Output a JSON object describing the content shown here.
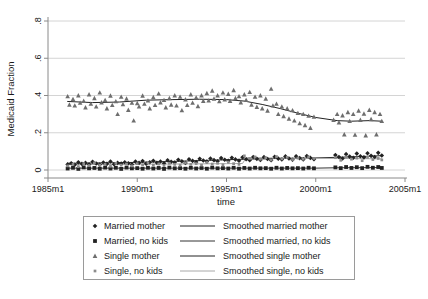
{
  "chart_data": {
    "type": "scatter",
    "title": "",
    "xlabel": "time",
    "ylabel": "Medicaid Fraction",
    "xlim": [
      1985.0,
      2005.0
    ],
    "ylim": [
      0,
      0.8
    ],
    "grid": true,
    "x_ticks": [
      "1985m1",
      "1990m1",
      "1995m1",
      "2000m1",
      "2005m1"
    ],
    "x_tick_values": [
      1985,
      1990,
      1995,
      2000,
      2005
    ],
    "y_ticks": [
      "0",
      ".2",
      ".4",
      ".6",
      ".8"
    ],
    "y_tick_values": [
      0,
      0.2,
      0.4,
      0.6,
      0.8
    ],
    "legend_position": "below-plot",
    "series": [
      {
        "name": "Married mother",
        "marker": "diamond",
        "color": "#222222",
        "x": [
          1986.1,
          1986.3,
          1986.5,
          1986.7,
          1986.9,
          1987.1,
          1987.3,
          1987.5,
          1987.7,
          1987.9,
          1988.1,
          1988.3,
          1988.5,
          1988.7,
          1988.9,
          1989.1,
          1989.3,
          1989.5,
          1989.7,
          1989.9,
          1990.1,
          1990.3,
          1990.5,
          1990.7,
          1990.9,
          1991.1,
          1991.3,
          1991.5,
          1991.7,
          1991.9,
          1992.1,
          1992.3,
          1992.5,
          1992.7,
          1992.9,
          1993.1,
          1993.3,
          1993.5,
          1993.7,
          1993.9,
          1994.1,
          1994.3,
          1994.5,
          1994.7,
          1994.9,
          1995.1,
          1995.3,
          1995.5,
          1995.7,
          1995.9,
          1996.1,
          1996.3,
          1996.5,
          1996.7,
          1996.9,
          1997.1,
          1997.3,
          1997.5,
          1997.7,
          1997.9,
          1998.1,
          1998.3,
          1998.5,
          1998.7,
          1998.9,
          1999.1,
          1999.3,
          1999.5,
          1999.7,
          1999.9,
          2001.1,
          2001.3,
          2001.5,
          2001.7,
          2001.9,
          2002.1,
          2002.3,
          2002.5,
          2002.7,
          2002.9,
          2003.1,
          2003.3,
          2003.5,
          2003.7
        ],
        "y": [
          0.03,
          0.036,
          0.028,
          0.041,
          0.033,
          0.038,
          0.03,
          0.044,
          0.035,
          0.029,
          0.04,
          0.033,
          0.046,
          0.031,
          0.038,
          0.034,
          0.042,
          0.036,
          0.03,
          0.045,
          0.038,
          0.048,
          0.034,
          0.042,
          0.05,
          0.039,
          0.046,
          0.036,
          0.052,
          0.044,
          0.04,
          0.055,
          0.047,
          0.038,
          0.058,
          0.049,
          0.043,
          0.06,
          0.051,
          0.046,
          0.062,
          0.053,
          0.047,
          0.064,
          0.055,
          0.049,
          0.066,
          0.057,
          0.05,
          0.068,
          0.058,
          0.052,
          0.07,
          0.06,
          0.054,
          0.069,
          0.059,
          0.053,
          0.071,
          0.061,
          0.056,
          0.073,
          0.062,
          0.055,
          0.074,
          0.064,
          0.057,
          0.075,
          0.065,
          0.058,
          0.08,
          0.07,
          0.062,
          0.085,
          0.072,
          0.066,
          0.088,
          0.074,
          0.068,
          0.09,
          0.076,
          0.07,
          0.092,
          0.078
        ]
      },
      {
        "name": "Married, no kids",
        "marker": "square",
        "color": "#222222",
        "x": [
          1986.1,
          1986.4,
          1986.7,
          1987.0,
          1987.3,
          1987.6,
          1987.9,
          1988.2,
          1988.5,
          1988.8,
          1989.1,
          1989.4,
          1989.7,
          1990.0,
          1990.3,
          1990.6,
          1990.9,
          1991.2,
          1991.5,
          1991.8,
          1992.1,
          1992.4,
          1992.7,
          1993.0,
          1993.3,
          1993.6,
          1993.9,
          1994.2,
          1994.5,
          1994.8,
          1995.1,
          1995.4,
          1995.7,
          1996.0,
          1996.3,
          1996.6,
          1996.9,
          1997.2,
          1997.5,
          1997.8,
          1998.1,
          1998.4,
          1998.7,
          1999.0,
          1999.3,
          1999.6,
          1999.9,
          2001.1,
          2001.4,
          2001.7,
          2002.0,
          2002.3,
          2002.6,
          2002.9,
          2003.2,
          2003.5,
          2003.7
        ],
        "y": [
          0.008,
          0.012,
          0.006,
          0.014,
          0.009,
          0.011,
          0.007,
          0.013,
          0.008,
          0.012,
          0.006,
          0.013,
          0.009,
          0.01,
          0.007,
          0.012,
          0.008,
          0.011,
          0.006,
          0.013,
          0.009,
          0.01,
          0.007,
          0.012,
          0.008,
          0.011,
          0.007,
          0.013,
          0.009,
          0.01,
          0.008,
          0.012,
          0.007,
          0.011,
          0.008,
          0.012,
          0.009,
          0.01,
          0.007,
          0.012,
          0.008,
          0.011,
          0.009,
          0.01,
          0.008,
          0.012,
          0.009,
          0.014,
          0.01,
          0.016,
          0.011,
          0.015,
          0.01,
          0.017,
          0.012,
          0.016,
          0.011
        ]
      },
      {
        "name": "Single mother",
        "marker": "triangle",
        "color": "#6e6e6e",
        "x": [
          1986.1,
          1986.2,
          1986.4,
          1986.5,
          1986.7,
          1986.8,
          1987.0,
          1987.1,
          1987.3,
          1987.4,
          1987.6,
          1987.7,
          1987.9,
          1988.0,
          1988.2,
          1988.3,
          1988.5,
          1988.6,
          1988.8,
          1988.9,
          1989.1,
          1989.2,
          1989.4,
          1989.5,
          1989.7,
          1989.8,
          1990.0,
          1990.1,
          1990.3,
          1990.4,
          1990.6,
          1990.7,
          1990.9,
          1991.0,
          1991.2,
          1991.3,
          1991.5,
          1991.6,
          1991.8,
          1991.9,
          1992.1,
          1992.2,
          1992.4,
          1992.5,
          1992.7,
          1992.8,
          1993.0,
          1993.1,
          1993.3,
          1993.4,
          1993.6,
          1993.7,
          1993.9,
          1994.0,
          1994.2,
          1994.3,
          1994.5,
          1994.6,
          1994.8,
          1994.9,
          1995.1,
          1995.2,
          1995.4,
          1995.5,
          1995.7,
          1995.8,
          1996.0,
          1996.1,
          1996.3,
          1996.4,
          1996.6,
          1996.7,
          1996.9,
          1997.0,
          1997.2,
          1997.3,
          1997.5,
          1997.6,
          1997.8,
          1997.9,
          1998.1,
          1998.2,
          1998.4,
          1998.5,
          1998.7,
          1998.8,
          1999.0,
          1999.1,
          1999.3,
          1999.4,
          1999.6,
          1999.7,
          1999.9,
          2001.0,
          2001.2,
          2001.3,
          2001.5,
          2001.6,
          2001.8,
          2001.9,
          2002.1,
          2002.2,
          2002.4,
          2002.5,
          2002.7,
          2002.8,
          2003.0,
          2003.1,
          2003.3,
          2003.4,
          2003.6,
          2003.7
        ],
        "y": [
          0.395,
          0.35,
          0.38,
          0.345,
          0.4,
          0.36,
          0.37,
          0.335,
          0.405,
          0.355,
          0.385,
          0.34,
          0.415,
          0.362,
          0.375,
          0.33,
          0.398,
          0.348,
          0.368,
          0.3,
          0.392,
          0.352,
          0.382,
          0.322,
          0.36,
          0.265,
          0.358,
          0.34,
          0.398,
          0.355,
          0.372,
          0.33,
          0.39,
          0.348,
          0.41,
          0.362,
          0.375,
          0.335,
          0.385,
          0.35,
          0.4,
          0.345,
          0.392,
          0.32,
          0.378,
          0.348,
          0.405,
          0.36,
          0.388,
          0.342,
          0.4,
          0.37,
          0.412,
          0.372,
          0.425,
          0.382,
          0.4,
          0.368,
          0.415,
          0.378,
          0.408,
          0.37,
          0.428,
          0.385,
          0.395,
          0.362,
          0.405,
          0.375,
          0.418,
          0.35,
          0.392,
          0.338,
          0.4,
          0.33,
          0.382,
          0.318,
          0.435,
          0.345,
          0.355,
          0.3,
          0.34,
          0.288,
          0.33,
          0.275,
          0.32,
          0.265,
          0.305,
          0.25,
          0.3,
          0.24,
          0.29,
          0.225,
          0.285,
          0.268,
          0.3,
          0.255,
          0.292,
          0.19,
          0.31,
          0.262,
          0.3,
          0.188,
          0.318,
          0.268,
          0.302,
          0.185,
          0.322,
          0.272,
          0.31,
          0.19,
          0.3,
          0.262
        ]
      },
      {
        "name": "Single, no kids",
        "marker": "dot",
        "color": "#8c8c8c",
        "x": [
          1986.1,
          1986.4,
          1986.7,
          1987.0,
          1987.3,
          1987.6,
          1987.9,
          1988.2,
          1988.5,
          1988.8,
          1989.1,
          1989.4,
          1989.7,
          1990.0,
          1990.3,
          1990.6,
          1990.9,
          1991.2,
          1991.5,
          1991.8,
          1992.1,
          1992.4,
          1992.7,
          1993.0,
          1993.3,
          1993.6,
          1993.9,
          1994.2,
          1994.5,
          1994.8,
          1995.1,
          1995.4,
          1995.7,
          1996.0,
          1996.3,
          1996.6,
          1996.9,
          1997.2,
          1997.5,
          1997.8,
          1998.1,
          1998.4,
          1998.7,
          1999.0,
          1999.3,
          1999.6,
          1999.9,
          2001.1,
          2001.4,
          2001.7,
          2002.0,
          2002.3,
          2002.6,
          2002.9,
          2003.2,
          2003.5,
          2003.7
        ],
        "y": [
          0.022,
          0.03,
          0.018,
          0.034,
          0.024,
          0.038,
          0.026,
          0.03,
          0.02,
          0.036,
          0.026,
          0.032,
          0.022,
          0.034,
          0.028,
          0.038,
          0.026,
          0.032,
          0.024,
          0.036,
          0.03,
          0.026,
          0.038,
          0.03,
          0.034,
          0.026,
          0.04,
          0.032,
          0.036,
          0.028,
          0.042,
          0.034,
          0.03,
          0.076,
          0.062,
          0.07,
          0.058,
          0.066,
          0.054,
          0.072,
          0.06,
          0.068,
          0.056,
          0.064,
          0.058,
          0.07,
          0.062,
          0.066,
          0.052,
          0.07,
          0.058,
          0.064,
          0.05,
          0.068,
          0.056,
          0.062,
          0.054
        ]
      }
    ],
    "smoothed": [
      {
        "name": "Smoothed married mother",
        "color": "#222222",
        "x": [
          1986.1,
          1988.0,
          1990.0,
          1992.0,
          1994.0,
          1996.0,
          1998.0,
          2000.0,
          2001.2,
          2003.0,
          2003.7
        ],
        "y": [
          0.036,
          0.038,
          0.041,
          0.046,
          0.052,
          0.058,
          0.062,
          0.065,
          0.068,
          0.074,
          0.077
        ]
      },
      {
        "name": "Smoothed married, no kids",
        "color": "#333333",
        "x": [
          1986.1,
          1989.0,
          1992.0,
          1995.0,
          1998.0,
          2000.0,
          2001.2,
          2003.7
        ],
        "y": [
          0.01,
          0.01,
          0.01,
          0.01,
          0.01,
          0.01,
          0.012,
          0.013
        ]
      },
      {
        "name": "Smoothed single mother",
        "color": "#222222",
        "x": [
          1986.1,
          1987.5,
          1989.0,
          1990.5,
          1992.0,
          1993.5,
          1995.0,
          1996.0,
          1997.0,
          1998.0,
          1999.0,
          2000.0,
          2001.2,
          2002.0,
          2003.0,
          2003.7
        ],
        "y": [
          0.368,
          0.362,
          0.365,
          0.375,
          0.378,
          0.38,
          0.378,
          0.37,
          0.352,
          0.33,
          0.305,
          0.282,
          0.265,
          0.262,
          0.265,
          0.262
        ]
      },
      {
        "name": "Smoothed single, no kids",
        "color": "#a8a8a8",
        "x": [
          1986.1,
          1989.0,
          1992.0,
          1995.0,
          1995.9,
          1996.1,
          1998.0,
          2000.0,
          2001.2,
          2003.7
        ],
        "y": [
          0.029,
          0.03,
          0.032,
          0.034,
          0.035,
          0.066,
          0.064,
          0.063,
          0.062,
          0.06
        ]
      }
    ]
  },
  "axes": {
    "y_label": "Medicaid Fraction",
    "x_label": "time",
    "y_ticks": [
      "0",
      ".2",
      ".4",
      ".6",
      ".8"
    ],
    "x_ticks": [
      "1985m1",
      "1990m1",
      "1995m1",
      "2000m1",
      "2005m1"
    ]
  },
  "legend": {
    "rows": [
      {
        "marker_label": "Married mother",
        "line_label": "Smoothed married mother"
      },
      {
        "marker_label": "Married, no kids",
        "line_label": "Smoothed married, no kids"
      },
      {
        "marker_label": "Single mother",
        "line_label": "Smoothed single mother"
      },
      {
        "marker_label": "Single, no kids",
        "line_label": "Smoothed single, no kids"
      }
    ]
  },
  "colors": {
    "marker_dark": "#222222",
    "marker_gray": "#6e6e6e",
    "marker_light_gray": "#8c8c8c",
    "grid": "#c9c9c9",
    "axis": "#8a8a8a",
    "legend_border": "#9a9a9a",
    "background": "#ffffff"
  }
}
